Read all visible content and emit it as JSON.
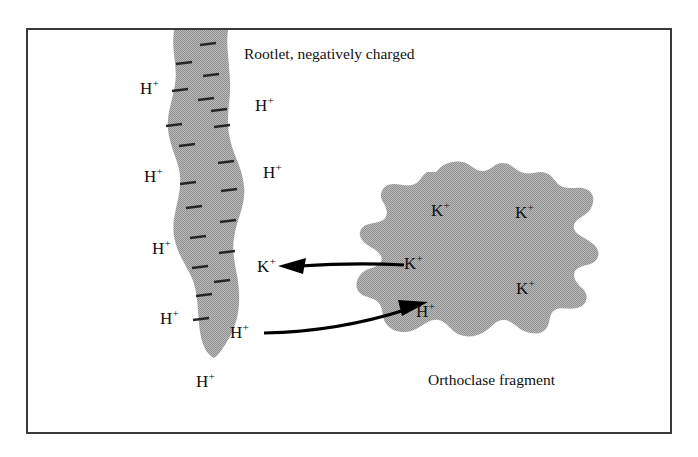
{
  "figure": {
    "title": "Rootlet, negatively charged",
    "colors": {
      "shape_fill": "#a9a9a9",
      "shape_fill_alt": "#a3a3a3",
      "frame_border": "#3a3a3a",
      "text": "#111111",
      "arrow": "#000000",
      "background": "#ffffff"
    }
  },
  "captions": [
    {
      "id": "rootlet-caption",
      "text": "Rootlet, negatively charged",
      "x": 244,
      "y": 46
    },
    {
      "id": "orthoclase-caption",
      "text": "Orthoclase fragment",
      "x": 428,
      "y": 372
    }
  ],
  "rootlet": {
    "name": "rootlet",
    "charge_symbol": "–",
    "negative_charge_count": 20,
    "ion_labels": [
      {
        "text": "H",
        "charge": "+",
        "x": 140,
        "y": 80,
        "side": "left"
      },
      {
        "text": "H",
        "charge": "+",
        "x": 255,
        "y": 97,
        "side": "right"
      },
      {
        "text": "H",
        "charge": "+",
        "x": 263,
        "y": 164,
        "side": "right"
      },
      {
        "text": "H",
        "charge": "+",
        "x": 144,
        "y": 168,
        "side": "left"
      },
      {
        "text": "K",
        "charge": "+",
        "x": 257,
        "y": 258,
        "side": "right"
      },
      {
        "text": "H",
        "charge": "+",
        "x": 152,
        "y": 240,
        "side": "left"
      },
      {
        "text": "H",
        "charge": "+",
        "x": 160,
        "y": 310,
        "side": "left"
      },
      {
        "text": "H",
        "charge": "+",
        "x": 230,
        "y": 324,
        "side": "right"
      },
      {
        "text": "H",
        "charge": "+",
        "x": 196,
        "y": 373,
        "side": "below"
      }
    ]
  },
  "orthoclase": {
    "name": "orthoclase-fragment",
    "ion_labels": [
      {
        "text": "K",
        "charge": "+",
        "x": 431,
        "y": 202
      },
      {
        "text": "K",
        "charge": "+",
        "x": 515,
        "y": 204
      },
      {
        "text": "K",
        "charge": "+",
        "x": 404,
        "y": 255
      },
      {
        "text": "K",
        "charge": "+",
        "x": 516,
        "y": 280
      },
      {
        "text": "H",
        "charge": "+",
        "x": 416,
        "y": 303
      }
    ]
  },
  "arrows": [
    {
      "id": "potassium-transfer-arrow",
      "label": "K+ moves from orthoclase fragment to rootlet",
      "direction": "left",
      "from": "orthoclase",
      "to": "rootlet",
      "ion": "K+"
    },
    {
      "id": "hydrogen-transfer-arrow",
      "label": "H+ moves from rootlet to orthoclase fragment",
      "direction": "right",
      "from": "rootlet",
      "to": "orthoclase",
      "ion": "H+"
    }
  ]
}
